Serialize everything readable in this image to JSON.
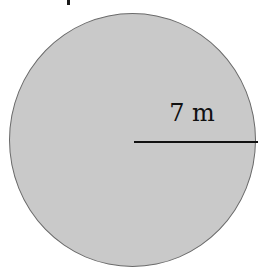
{
  "diagram": {
    "shape": "circle",
    "fill_color": "#c9c9c9",
    "outline_color": "#6a6a6a",
    "radius_line_color": "#111111",
    "radius": {
      "value": 7,
      "unit": "m",
      "label": "7 m"
    }
  }
}
